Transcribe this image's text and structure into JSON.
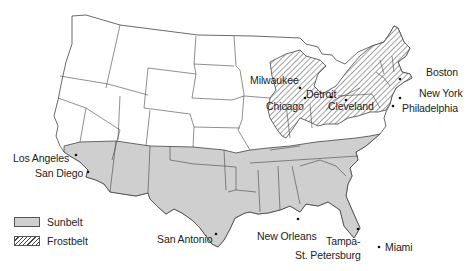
{
  "map": {
    "title": "",
    "region_colors": {
      "sunbelt_fill": "#cfcfcf",
      "frostbelt_hatch": "#444444",
      "other_fill": "#ffffff",
      "border": "#444444"
    },
    "cities": [
      {
        "name": "Milwaukee",
        "x": 274,
        "y": 80
      },
      {
        "name": "Chicago",
        "x": 266,
        "y": 101
      },
      {
        "name": "Detroit",
        "x": 306,
        "y": 89
      },
      {
        "name": "Cleveland",
        "x": 330,
        "y": 101
      },
      {
        "name": "Boston",
        "x": 426,
        "y": 71
      },
      {
        "name": "New York",
        "x": 419,
        "y": 91
      },
      {
        "name": "Philadelphia",
        "x": 402,
        "y": 106
      },
      {
        "name": "Los Angeles",
        "x": 13,
        "y": 157
      },
      {
        "name": "San Diego",
        "x": 35,
        "y": 172
      },
      {
        "name": "San Antonio",
        "x": 157,
        "y": 238
      },
      {
        "name": "New Orleans",
        "x": 257,
        "y": 235
      },
      {
        "name": "Tampa-",
        "x": 326,
        "y": 239
      },
      {
        "name": "St. Petersburg",
        "x": 296,
        "y": 252
      },
      {
        "name": "Miami",
        "x": 385,
        "y": 245
      }
    ]
  },
  "legend": {
    "items": [
      {
        "label": "Sunbelt",
        "style": "solid-gray"
      },
      {
        "label": "Frostbelt",
        "style": "diagonal-hatch"
      }
    ]
  }
}
